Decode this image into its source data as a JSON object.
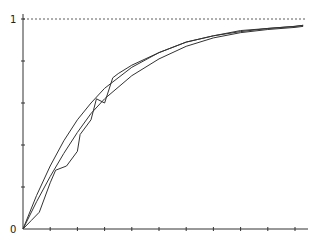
{
  "chart_data": {
    "type": "line",
    "title": "",
    "xlabel": "",
    "ylabel": "",
    "ylim": [
      0,
      1
    ],
    "xlim": [
      0,
      11
    ],
    "y_tick_labels": [
      "0",
      "1"
    ],
    "y_ticks": [
      0,
      0.2,
      0.4,
      0.6,
      0.8,
      1.0
    ],
    "x_ticks": [
      0,
      1,
      2,
      3,
      4,
      5,
      6,
      7,
      8,
      9,
      10,
      11
    ],
    "reference_line": {
      "y": 1,
      "style": "dashed"
    },
    "grid": false,
    "legend": null,
    "series": [
      {
        "name": "smooth-curve-a",
        "style": "solid",
        "x": [
          0,
          0.5,
          1,
          1.5,
          2,
          2.5,
          3,
          4,
          5,
          6,
          7,
          8,
          9,
          10,
          10.3
        ],
        "values": [
          0,
          0.16,
          0.3,
          0.42,
          0.52,
          0.6,
          0.67,
          0.77,
          0.84,
          0.89,
          0.92,
          0.94,
          0.955,
          0.965,
          0.97
        ]
      },
      {
        "name": "smooth-curve-b",
        "style": "solid",
        "x": [
          0,
          0.5,
          1,
          1.5,
          2,
          2.5,
          3,
          4,
          5,
          6,
          7,
          8,
          9,
          10,
          10.3
        ],
        "values": [
          0,
          0.13,
          0.25,
          0.36,
          0.46,
          0.55,
          0.62,
          0.73,
          0.81,
          0.87,
          0.91,
          0.935,
          0.95,
          0.96,
          0.965
        ]
      },
      {
        "name": "empirical-step-curve",
        "style": "solid",
        "x": [
          0,
          0.3,
          0.6,
          1.0,
          1.2,
          1.6,
          2.0,
          2.1,
          2.5,
          2.7,
          3.0,
          3.3,
          3.5,
          4,
          5,
          6,
          7,
          8,
          9,
          10,
          10.3
        ],
        "values": [
          0,
          0.04,
          0.08,
          0.22,
          0.28,
          0.3,
          0.37,
          0.45,
          0.52,
          0.62,
          0.6,
          0.72,
          0.74,
          0.78,
          0.84,
          0.89,
          0.92,
          0.945,
          0.955,
          0.965,
          0.97
        ]
      }
    ]
  },
  "axes": {
    "y_label_top": "1",
    "y_label_origin": "0"
  }
}
